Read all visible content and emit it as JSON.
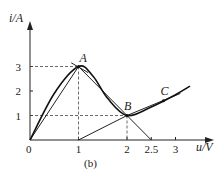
{
  "chart_data": {
    "type": "line",
    "title": "",
    "caption": "(b)",
    "xlabel": "u/V",
    "ylabel": "i/A",
    "origin_label": "0",
    "xlim": [
      0,
      3.3
    ],
    "ylim": [
      0,
      3.5
    ],
    "x_ticks": [
      1,
      2,
      2.5,
      3
    ],
    "x_tick_labels": [
      "1",
      "2",
      "2.5",
      "3"
    ],
    "y_ticks": [
      1,
      2,
      3
    ],
    "y_tick_labels": [
      "1",
      "2",
      "3"
    ],
    "curve": {
      "name": "i-u characteristic",
      "points": [
        [
          0,
          0
        ],
        [
          0.5,
          1.9
        ],
        [
          1,
          3
        ],
        [
          1.3,
          2.6
        ],
        [
          1.6,
          1.7
        ],
        [
          2,
          1
        ],
        [
          2.5,
          1.35
        ],
        [
          3,
          1.85
        ],
        [
          3.3,
          2.2
        ]
      ]
    },
    "lines": [
      {
        "name": "chord-origin-A",
        "from": [
          0,
          0
        ],
        "to": [
          1,
          3
        ]
      },
      {
        "name": "tangent-at-A",
        "from": [
          0.85,
          3.15
        ],
        "to": [
          1.2,
          2.75
        ]
      },
      {
        "name": "line-B-to-2.5",
        "from": [
          1.0,
          3.0
        ],
        "to": [
          2.5,
          0
        ]
      },
      {
        "name": "line-1-to-B",
        "from": [
          1,
          0
        ],
        "to": [
          2,
          1
        ]
      },
      {
        "name": "tangent-near-C",
        "from": [
          2,
          1
        ],
        "to": [
          3.1,
          1.9
        ]
      }
    ],
    "dashed_guides": [
      {
        "name": "A-guide",
        "point": [
          1,
          3
        ]
      },
      {
        "name": "B-guide",
        "point": [
          2,
          1
        ]
      }
    ],
    "points": [
      {
        "label": "A",
        "x": 1,
        "y": 3
      },
      {
        "label": "B",
        "x": 2,
        "y": 1
      },
      {
        "label": "C",
        "x": 2.75,
        "y": 1.6
      }
    ]
  }
}
